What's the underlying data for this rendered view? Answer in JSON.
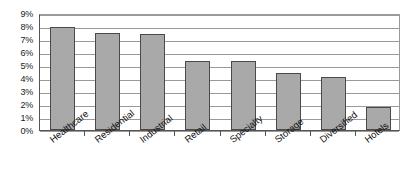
{
  "chart_data": {
    "type": "bar",
    "title": "",
    "subtitle": "",
    "xlabel": "",
    "ylabel": "",
    "categories": [
      "Healthcare",
      "Residential",
      "Industrial",
      "Retail",
      "Specialty",
      "Storage",
      "Diversified",
      "Hotels"
    ],
    "values": [
      7.9,
      7.5,
      7.4,
      5.3,
      5.3,
      4.4,
      4.1,
      1.8
    ],
    "value_unit": "%",
    "ylim": [
      0,
      9
    ],
    "ytick_step": 1,
    "ytick_labels": [
      "9%",
      "8%",
      "7%",
      "6%",
      "5%",
      "4%",
      "3%",
      "2%",
      "1%",
      "0%"
    ],
    "ytick_values": [
      9,
      8,
      7,
      6,
      5,
      4,
      3,
      2,
      1,
      0
    ],
    "grid": true,
    "grid_axis": "y",
    "legend": false,
    "legend_position": "none",
    "bar_fill_color": "#a9a9a9",
    "bar_border_color": "#4a4a4a",
    "gridline_color": "#9a9a9a",
    "axis_color": "#555555",
    "background_color": "#ffffff",
    "xtick_label_rotation": -38
  }
}
